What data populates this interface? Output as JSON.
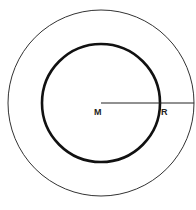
{
  "diagram": {
    "type": "concentric-circles",
    "center": {
      "x": 101,
      "y": 103
    },
    "outer_circle": {
      "radius": 93,
      "stroke": "#333333",
      "stroke_width": 1
    },
    "inner_circle": {
      "radius": 59,
      "stroke": "#111111",
      "stroke_width": 2.6
    },
    "radius_line": {
      "x1": 101,
      "y1": 103,
      "x2": 194,
      "y2": 103,
      "stroke": "#222222"
    },
    "labels": {
      "center": "M",
      "radius": "R"
    }
  }
}
